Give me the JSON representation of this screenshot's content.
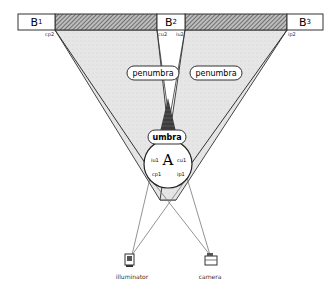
{
  "diagram": {
    "boxes": [
      {
        "id": "B1",
        "label": "B",
        "sub": "1"
      },
      {
        "id": "B2",
        "label": "B",
        "sub": "2"
      },
      {
        "id": "B3",
        "label": "B",
        "sub": "3"
      }
    ],
    "regions": {
      "penumbra_left": "penumbra",
      "penumbra_right": "penumbra",
      "umbra": "umbra"
    },
    "object": {
      "label": "A",
      "points": {
        "iu1": "iu1",
        "cu1": "cu1",
        "cp1": "cp1",
        "ip1": "ip1"
      }
    },
    "edge_labels": {
      "cp2_left": "cp2",
      "cu2": "cu2",
      "iu2": "iu2",
      "ip2": "ip2"
    },
    "devices": {
      "illuminator": "illuminator",
      "camera": "camera"
    },
    "colors": {
      "penumbra": "#e4e4e4",
      "umbra": "#3a3a3a",
      "hatch": "#555555",
      "line": "#777777"
    }
  }
}
